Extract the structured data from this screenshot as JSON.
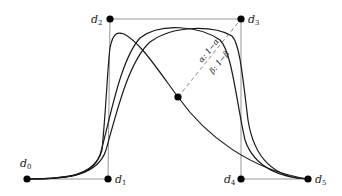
{
  "diagram": {
    "title": "",
    "control_points": [
      {
        "id": "d0",
        "label": "d",
        "sub": "0",
        "x": 27,
        "y": 179
      },
      {
        "id": "d1",
        "label": "d",
        "sub": "1",
        "x": 108,
        "y": 179
      },
      {
        "id": "d2",
        "label": "d",
        "sub": "2",
        "x": 110,
        "y": 19
      },
      {
        "id": "d3",
        "label": "d",
        "sub": "3",
        "x": 241,
        "y": 19
      },
      {
        "id": "d4",
        "label": "d",
        "sub": "4",
        "x": 241,
        "y": 179
      },
      {
        "id": "d5",
        "label": "d",
        "sub": "5",
        "x": 308,
        "y": 179
      }
    ],
    "center_point": {
      "x": 178,
      "y": 97
    },
    "ratio_labels": {
      "alpha": "α: 1−α",
      "beta": "β: 1−β"
    },
    "colors": {
      "curve": "#1a1a1a",
      "polygon": "#888888",
      "point": "#000000",
      "dashed": "#777777"
    }
  }
}
